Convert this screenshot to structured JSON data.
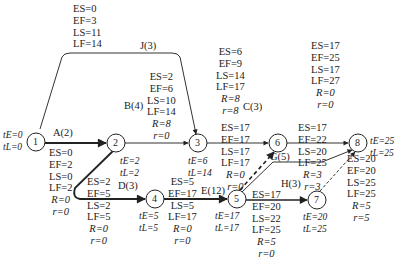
{
  "nodes": [
    {
      "id": "1",
      "label": "1",
      "tE": "tE=0",
      "tL": "tL=0"
    },
    {
      "id": "2",
      "label": "2",
      "tE": "tE=2",
      "tL": "tL=2"
    },
    {
      "id": "3",
      "label": "3",
      "tE": "tE=6",
      "tL": "tL=14"
    },
    {
      "id": "4",
      "label": "4",
      "tE": "tE=5",
      "tL": "tL=5"
    },
    {
      "id": "5",
      "label": "5",
      "tE": "tE=17",
      "tL": "tL=17"
    },
    {
      "id": "6",
      "label": "6"
    },
    {
      "id": "7",
      "label": "7",
      "tE": "tE=20",
      "tL": "tL=25"
    },
    {
      "id": "8",
      "label": "8",
      "tE": "tE=25",
      "tL": "tL=25"
    }
  ],
  "activities": {
    "J": {
      "name": "J(3)",
      "ES": "ES=0",
      "EF": "EF=3",
      "LS": "LS=11",
      "LF": "LF=14"
    },
    "A": {
      "name": "A(2)",
      "ES": "ES=0",
      "EF": "EF=2",
      "LS": "LS=0",
      "LF": "LF=2",
      "R": "R=0",
      "r": "r=0"
    },
    "B": {
      "name": "B(4)",
      "ES": "ES=2",
      "EF": "EF=6",
      "LS": "LS=10",
      "LF": "LF=14",
      "R": "R=8",
      "r": "r=0"
    },
    "C": {
      "name": "C(3)",
      "ES": "ES=6",
      "EF": "EF=9",
      "LS": "LS=14",
      "LF": "LF=17",
      "R": "R=8",
      "r": "r=8"
    },
    "D": {
      "name": "D(3)",
      "ES": "ES=2",
      "EF": "EF=5",
      "LS": "LS=2",
      "LF": "LF=5",
      "R": "R=0",
      "r": "r=0"
    },
    "E": {
      "name": "E(12)",
      "ES": "ES=5",
      "EF": "EF=17",
      "LS": "LS=5",
      "LF": "LF=17",
      "R": "R=0",
      "r": "r=0"
    },
    "dummy56": {
      "ES": "ES=17",
      "EF": "EF=17",
      "LS": "LS=17",
      "LF": "LF=17",
      "R": "R=0",
      "r": "r=0"
    },
    "F68": {
      "ES": "ES=17",
      "EF": "EF=25",
      "LS": "LS=17",
      "LF": "LF=27",
      "R": "R=0",
      "r": "r=0"
    },
    "G": {
      "name": "G(5)",
      "ES": "ES=17",
      "EF": "EF=22",
      "LS": "LS=20",
      "LF": "LF=25",
      "R": "R=3",
      "r": "r=3"
    },
    "H": {
      "name": "H(3)",
      "ES": "ES=17",
      "EF": "EF=20",
      "LS": "LS=22",
      "LF": "LF=25",
      "R": "R=5",
      "r": "r=0"
    },
    "dummy78": {
      "ES": "ES=20",
      "EF": "EF=20",
      "LS": "LS=25",
      "LF": "LF=25",
      "R": "R=5",
      "r": "r=5"
    }
  }
}
